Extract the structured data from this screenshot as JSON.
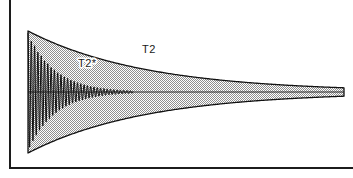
{
  "figure": {
    "background_color": "#ffffff",
    "frame": {
      "name": "figure-frame",
      "left_border_color": "#1c1c1c",
      "bottom_border_color": "#1c1c1c",
      "left_x": 10,
      "top_y": 0,
      "bottom_y": 168,
      "right_x": 353,
      "border_width": 2
    },
    "labels": [
      {
        "id": "t2star",
        "text": "T2*",
        "x": 78,
        "y": 67
      },
      {
        "id": "t2",
        "text": "T2",
        "x": 142,
        "y": 53
      }
    ],
    "envelope": {
      "name": "t2-decay-envelope",
      "fill_pattern": "stipple-checker",
      "fill_color": "#9a9a9a",
      "outline_color": "#111111",
      "outline_width": 1.3,
      "start_x": 28,
      "end_x": 344,
      "baseline_y": 92,
      "start_amplitude": 61,
      "end_amplitude": 2,
      "decay_constant_px": 118
    },
    "baseline": {
      "name": "signal-baseline",
      "color": "#2b2b2b",
      "width": 1,
      "y": 92,
      "x_start": 28,
      "x_end": 344
    },
    "oscillation": {
      "name": "fid-oscillation-trace",
      "color": "#101010",
      "line_width": 1,
      "start_x": 28,
      "end_x": 133,
      "period_px": 3.3,
      "decay_constant_px": 27,
      "start_amplitude": 59,
      "sample_count": 430
    }
  },
  "chart_data": {
    "type": "line",
    "xlabel": "",
    "ylabel": "",
    "grid": false,
    "legend_position": "inline-annotations",
    "annotations": [
      "T2*",
      "T2"
    ],
    "series": [
      {
        "name": "T2 envelope (upper)",
        "description": "Slow exponential decay envelope, upper bound",
        "model": "A0 * exp(-x / T2)",
        "A0": 61,
        "T2_px": 118,
        "x_range": [
          28,
          344
        ]
      },
      {
        "name": "T2 envelope (lower)",
        "description": "Slow exponential decay envelope, lower bound (mirror)",
        "model": "-A0 * exp(-x / T2)",
        "A0": 61,
        "T2_px": 118,
        "x_range": [
          28,
          344
        ]
      },
      {
        "name": "T2* FID signal",
        "description": "Rapidly damped oscillating free induction decay",
        "model": "A0 * exp(-x / T2star) * cos(2*pi*x / period)",
        "A0": 59,
        "T2star_px": 27,
        "period_px": 3.3,
        "x_range": [
          28,
          133
        ]
      },
      {
        "name": "baseline",
        "description": "Zero signal baseline",
        "values": [
          0,
          0
        ],
        "x_range": [
          28,
          344
        ]
      }
    ]
  }
}
